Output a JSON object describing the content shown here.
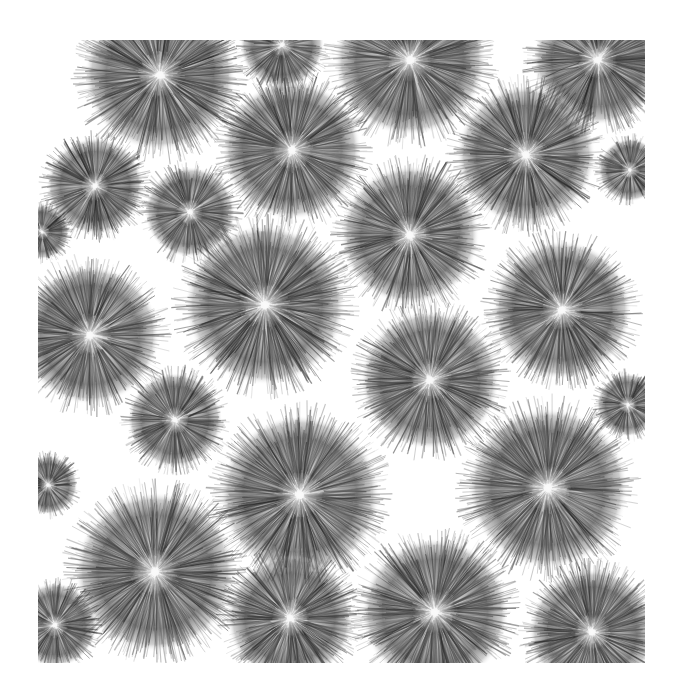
{
  "image": {
    "description": "Grayscale photo-like pattern of fuzzy spherical seed heads (pom-pom shapes) on white background",
    "frame": {
      "x": 38,
      "y": 40,
      "width": 607,
      "height": 623
    },
    "background": "#ffffff",
    "ink": "#1a1a1a",
    "puffs": [
      {
        "cx": 160,
        "cy": 75,
        "r": 72
      },
      {
        "cx": 282,
        "cy": 45,
        "r": 40
      },
      {
        "cx": 410,
        "cy": 60,
        "r": 72
      },
      {
        "cx": 598,
        "cy": 60,
        "r": 62
      },
      {
        "cx": 95,
        "cy": 186,
        "r": 46
      },
      {
        "cx": 190,
        "cy": 212,
        "r": 43
      },
      {
        "cx": 292,
        "cy": 150,
        "r": 66
      },
      {
        "cx": 410,
        "cy": 235,
        "r": 66
      },
      {
        "cx": 526,
        "cy": 155,
        "r": 66
      },
      {
        "cx": 42,
        "cy": 232,
        "r": 26
      },
      {
        "cx": 630,
        "cy": 170,
        "r": 30
      },
      {
        "cx": 265,
        "cy": 305,
        "r": 76
      },
      {
        "cx": 90,
        "cy": 335,
        "r": 66
      },
      {
        "cx": 562,
        "cy": 310,
        "r": 66
      },
      {
        "cx": 430,
        "cy": 380,
        "r": 66
      },
      {
        "cx": 175,
        "cy": 420,
        "r": 45
      },
      {
        "cx": 628,
        "cy": 405,
        "r": 30
      },
      {
        "cx": 48,
        "cy": 485,
        "r": 28
      },
      {
        "cx": 300,
        "cy": 495,
        "r": 76
      },
      {
        "cx": 548,
        "cy": 488,
        "r": 76
      },
      {
        "cx": 155,
        "cy": 572,
        "r": 76
      },
      {
        "cx": 435,
        "cy": 612,
        "r": 70
      },
      {
        "cx": 290,
        "cy": 618,
        "r": 60
      },
      {
        "cx": 592,
        "cy": 632,
        "r": 60
      },
      {
        "cx": 55,
        "cy": 625,
        "r": 40
      }
    ]
  }
}
